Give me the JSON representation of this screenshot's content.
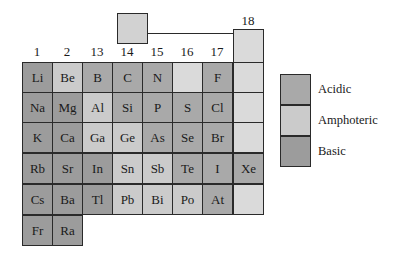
{
  "colors": {
    "acidic": "#a9a9a9",
    "amphoteric": "#cbcbcb",
    "basic": "#9c9c9c",
    "none": "#dadada"
  },
  "group_labels": [
    "1",
    "2",
    "13",
    "14",
    "15",
    "16",
    "17",
    "18"
  ],
  "hydrogen_box": {
    "label": ""
  },
  "rows": [
    [
      {
        "s": "Li",
        "t": "basic"
      },
      {
        "s": "Be",
        "t": "amphoteric"
      },
      {
        "s": "B",
        "t": "acidic"
      },
      {
        "s": "C",
        "t": "acidic"
      },
      {
        "s": "N",
        "t": "acidic"
      },
      {
        "s": "",
        "t": "none"
      },
      {
        "s": "F",
        "t": "acidic"
      },
      {
        "s": "",
        "t": "none"
      }
    ],
    [
      {
        "s": "Na",
        "t": "basic"
      },
      {
        "s": "Mg",
        "t": "basic"
      },
      {
        "s": "Al",
        "t": "amphoteric"
      },
      {
        "s": "Si",
        "t": "acidic"
      },
      {
        "s": "P",
        "t": "acidic"
      },
      {
        "s": "S",
        "t": "acidic"
      },
      {
        "s": "Cl",
        "t": "acidic"
      },
      {
        "s": "",
        "t": "none"
      }
    ],
    [
      {
        "s": "K",
        "t": "basic"
      },
      {
        "s": "Ca",
        "t": "basic"
      },
      {
        "s": "Ga",
        "t": "amphoteric"
      },
      {
        "s": "Ge",
        "t": "amphoteric"
      },
      {
        "s": "As",
        "t": "acidic"
      },
      {
        "s": "Se",
        "t": "acidic"
      },
      {
        "s": "Br",
        "t": "acidic"
      },
      {
        "s": "",
        "t": "none"
      }
    ],
    [
      {
        "s": "Rb",
        "t": "basic"
      },
      {
        "s": "Sr",
        "t": "basic"
      },
      {
        "s": "In",
        "t": "basic"
      },
      {
        "s": "Sn",
        "t": "amphoteric"
      },
      {
        "s": "Sb",
        "t": "amphoteric"
      },
      {
        "s": "Te",
        "t": "acidic"
      },
      {
        "s": "I",
        "t": "acidic"
      },
      {
        "s": "Xe",
        "t": "acidic"
      }
    ],
    [
      {
        "s": "Cs",
        "t": "basic"
      },
      {
        "s": "Ba",
        "t": "basic"
      },
      {
        "s": "Tl",
        "t": "basic"
      },
      {
        "s": "Pb",
        "t": "amphoteric"
      },
      {
        "s": "Bi",
        "t": "amphoteric"
      },
      {
        "s": "Po",
        "t": "amphoteric"
      },
      {
        "s": "At",
        "t": "acidic"
      },
      {
        "s": "",
        "t": "none"
      }
    ],
    [
      {
        "s": "Fr",
        "t": "basic"
      },
      {
        "s": "Ra",
        "t": "basic"
      }
    ]
  ],
  "legend": [
    {
      "label": "Acidic",
      "type": "acidic"
    },
    {
      "label": "Amphoteric",
      "type": "amphoteric"
    },
    {
      "label": "Basic",
      "type": "basic"
    }
  ]
}
